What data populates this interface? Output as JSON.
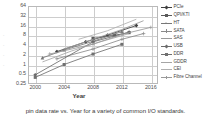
{
  "caption": "pin data rate vs. Year for a variety of common I/O standards.",
  "chart_data": {
    "type": "line",
    "title": "",
    "xlabel": "Year",
    "ylabel": "",
    "xlim": [
      1999,
      2017
    ],
    "ylim": [
      0.25,
      64
    ],
    "yscale": "log2",
    "grid": true,
    "legend_position": "right",
    "xticks": [
      "2000",
      "2004",
      "2008",
      "2012",
      "2016"
    ],
    "xtick_values": [
      2000,
      2004,
      2008,
      2012,
      2016
    ],
    "yticks": [
      "64",
      "32",
      "16",
      "8",
      "4",
      "2",
      "1",
      "0.5",
      "0.25"
    ],
    "ytick_values": [
      64,
      32,
      16,
      8,
      4,
      2,
      1,
      0.5,
      0.25
    ],
    "y_artifacts": [
      "-",
      "-",
      "-",
      "-"
    ],
    "series": [
      {
        "name": "PCIe",
        "color": "#3f3f3f",
        "marker": "diamond",
        "x": [
          2003,
          2007,
          2010,
          2014
        ],
        "y": [
          2.5,
          5.0,
          8.0,
          16.0
        ]
      },
      {
        "name": "QPI/KTI",
        "color": "#5a5a5a",
        "marker": "square",
        "x": [
          2008,
          2011,
          2013
        ],
        "y": [
          6.4,
          8.0,
          9.6
        ]
      },
      {
        "name": "HT",
        "color": "#777777",
        "marker": "triangle",
        "x": [
          2001,
          2004,
          2008,
          2012
        ],
        "y": [
          1.6,
          2.8,
          5.2,
          10.4
        ]
      },
      {
        "name": "SATA",
        "color": "#8a8a8a",
        "marker": "cross",
        "x": [
          2003,
          2008,
          2012,
          2015
        ],
        "y": [
          1.5,
          3.0,
          6.0,
          9.0
        ]
      },
      {
        "name": "SAS",
        "color": "#9a9a9a",
        "marker": "none",
        "x": [
          2004,
          2008,
          2012,
          2015
        ],
        "y": [
          3.0,
          6.0,
          12.0,
          22.5
        ]
      },
      {
        "name": "USB",
        "color": "#6b6b6b",
        "marker": "diamond",
        "x": [
          2000,
          2008,
          2013
        ],
        "y": [
          0.48,
          5.0,
          10.0
        ]
      },
      {
        "name": "DDR",
        "color": "#707070",
        "marker": "square",
        "x": [
          2000,
          2004,
          2008,
          2012
        ],
        "y": [
          0.4,
          1.0,
          2.1,
          4.2
        ]
      },
      {
        "name": "GDDR",
        "color": "#a5a5a5",
        "marker": "none",
        "x": [
          2001,
          2005,
          2009,
          2013
        ],
        "y": [
          1.2,
          2.6,
          5.0,
          9.0
        ]
      },
      {
        "name": "CEI",
        "color": "#b0b0b0",
        "marker": "none",
        "x": [
          2006,
          2010,
          2014
        ],
        "y": [
          6.0,
          11.0,
          25.0
        ]
      },
      {
        "name": "Fibre Channel",
        "color": "#999999",
        "marker": "cross",
        "x": [
          2002,
          2008,
          2012,
          2016
        ],
        "y": [
          2.1,
          4.25,
          8.5,
          14.0
        ]
      }
    ]
  }
}
